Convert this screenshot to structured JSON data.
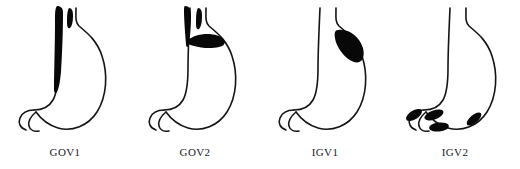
{
  "figure": {
    "background_color": "#ffffff",
    "outline_color": "#141414",
    "varix_color": "#080808"
  },
  "panels": [
    {
      "label": "GOV1",
      "name": "gov1",
      "description": "Gastroesophageal varix type 1: varices extend from the esophagus along the lesser curvature of the stomach",
      "varix_regions": [
        "distal esophagus",
        "lesser curvature"
      ],
      "varix_count": 2
    },
    {
      "label": "GOV2",
      "name": "gov2",
      "description": "Gastroesophageal varix type 2: varices extend from the esophagus into the gastric fundus",
      "varix_regions": [
        "distal esophagus",
        "cardia",
        "fundus"
      ],
      "varix_count": 3
    },
    {
      "label": "IGV1",
      "name": "igv1",
      "description": "Isolated gastric varix type 1: varices confined to the gastric fundus with no esophageal varices",
      "varix_regions": [
        "fundus"
      ],
      "varix_count": 1
    },
    {
      "label": "IGV2",
      "name": "igv2",
      "description": "Isolated gastric varix type 2: ectopic varices scattered in the gastric body, antrum and around the pylorus",
      "varix_regions": [
        "body",
        "antrum",
        "pylorus",
        "duodenum"
      ],
      "varix_count": 4
    }
  ]
}
